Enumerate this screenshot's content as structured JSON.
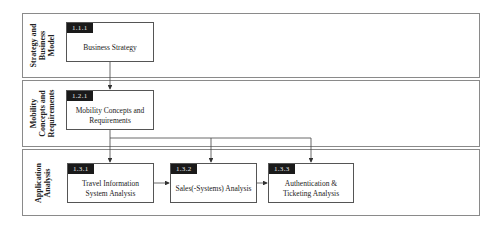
{
  "lanes": [
    {
      "label": "Strategy and\nBusiness\nModel"
    },
    {
      "label": "Mobility\nConcepts and\nRequirements"
    },
    {
      "label": "Application\nAnalysis"
    }
  ],
  "boxes": [
    {
      "id": "1.1.1",
      "text": "Business Strategy"
    },
    {
      "id": "1.2.1",
      "text": "Mobility Concepts and\nRequirements"
    },
    {
      "id": "1.3.1",
      "text": "Travel Information\nSystem Analysis"
    },
    {
      "id": "1.3.2",
      "text": "Sales(-Systems) Analysis"
    },
    {
      "id": "1.3.3",
      "text": "Authentication &\nTicketing Analysis"
    }
  ],
  "colors": {
    "border": "#8a8a8a",
    "id_bg": "#1a1a1a",
    "line": "#444444"
  }
}
